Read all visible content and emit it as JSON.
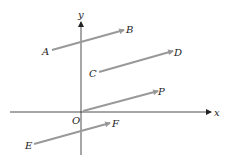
{
  "diagram": {
    "axes": {
      "x_label": "x",
      "y_label": "y",
      "origin_label": "O"
    },
    "vectors": [
      {
        "start": "A",
        "end": "B",
        "x1": 52,
        "y1": 50,
        "x2": 124,
        "y2": 30
      },
      {
        "start": "C",
        "end": "D",
        "x1": 99,
        "y1": 72,
        "x2": 173,
        "y2": 51
      },
      {
        "start": "O",
        "end": "P",
        "x1": 83,
        "y1": 111,
        "x2": 158,
        "y2": 91
      },
      {
        "start": "E",
        "end": "F",
        "x1": 34,
        "y1": 144,
        "x2": 110,
        "y2": 123
      }
    ],
    "colors": {
      "vector": "#999999",
      "axis": "#222222"
    }
  }
}
